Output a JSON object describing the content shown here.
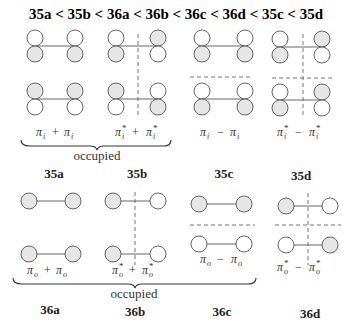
{
  "title": {
    "order": [
      "35a",
      "35b",
      "36a",
      "36b",
      "36c",
      "36d",
      "35c",
      "35d"
    ],
    "separator": "<",
    "text": "35a < 35b < 36a < 36b < 36c < 36d < 35c < 35d"
  },
  "top_row": {
    "group_label": "occupied",
    "diagrams": [
      {
        "id": "35a",
        "formula": "πi + πi",
        "upper": {
          "left_lobe_shaded": "bottom",
          "right_lobe_shaded": "bottom"
        },
        "lower": {
          "left_lobe_shaded": "top",
          "right_lobe_shaded": "top"
        },
        "vertical_node": false,
        "horizontal_node": false
      },
      {
        "id": "35b",
        "formula": "πi* + πi*",
        "upper": {
          "left_lobe_shaded": "bottom",
          "right_lobe_shaded": "top"
        },
        "lower": {
          "left_lobe_shaded": "top",
          "right_lobe_shaded": "bottom"
        },
        "vertical_node": true,
        "horizontal_node": false
      },
      {
        "id": "35c",
        "formula": "πi − πi",
        "upper": {
          "left_lobe_shaded": "bottom",
          "right_lobe_shaded": "bottom"
        },
        "lower": {
          "left_lobe_shaded": "bottom",
          "right_lobe_shaded": "bottom"
        },
        "vertical_node": false,
        "horizontal_node": true
      },
      {
        "id": "35d",
        "formula": "πi* − πi*",
        "upper": {
          "left_lobe_shaded": "bottom",
          "right_lobe_shaded": "top"
        },
        "lower": {
          "left_lobe_shaded": "bottom",
          "right_lobe_shaded": "top"
        },
        "vertical_node": true,
        "horizontal_node": true
      }
    ],
    "labels": [
      "35a",
      "35b",
      "35c",
      "35d"
    ],
    "formulas": {
      "a": {
        "base": "π",
        "sub": "i",
        "star": "",
        "op": "+"
      },
      "b": {
        "base": "π",
        "sub": "i",
        "star": "*",
        "op": "+"
      },
      "c": {
        "base": "π",
        "sub": "i",
        "star": "",
        "op": "−"
      },
      "d": {
        "base": "π",
        "sub": "i",
        "star": "*",
        "op": "−"
      }
    }
  },
  "bottom_row": {
    "group_label": "occupied",
    "diagrams": [
      {
        "id": "36a",
        "formula": "πo + πo",
        "upper": {
          "left_shaded": true,
          "right_shaded": true
        },
        "lower": {
          "left_shaded": true,
          "right_shaded": true
        },
        "vertical_node": false,
        "horizontal_node": false
      },
      {
        "id": "36b",
        "formula": "πo* + πo*",
        "upper": {
          "left_shaded": true,
          "right_shaded": false
        },
        "lower": {
          "left_shaded": true,
          "right_shaded": false
        },
        "vertical_node": true,
        "horizontal_node": false
      },
      {
        "id": "36c",
        "formula": "πo − πo",
        "upper": {
          "left_shaded": true,
          "right_shaded": true
        },
        "lower": {
          "left_shaded": false,
          "right_shaded": false
        },
        "vertical_node": false,
        "horizontal_node": true
      },
      {
        "id": "36d",
        "formula": "πo* − πo*",
        "upper": {
          "left_shaded": true,
          "right_shaded": false
        },
        "lower": {
          "left_shaded": false,
          "right_shaded": true
        },
        "vertical_node": true,
        "horizontal_node": true
      }
    ],
    "labels": [
      "36a",
      "36b",
      "36c",
      "36d"
    ],
    "formulas": {
      "a": {
        "base": "π",
        "sub": "o",
        "star": "",
        "op": "+"
      },
      "b": {
        "base": "π",
        "sub": "o",
        "star": "*",
        "op": "+"
      },
      "c": {
        "base": "π",
        "sub": "o",
        "star": "",
        "op": "−"
      },
      "d": {
        "base": "π",
        "sub": "o",
        "star": "*",
        "op": "−"
      }
    }
  },
  "colors": {
    "shaded_lobe": "#e6e6e6",
    "outline": "#555555",
    "node_line": "#666666"
  }
}
